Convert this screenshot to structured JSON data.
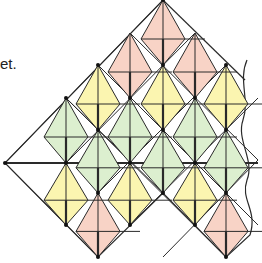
{
  "caption": "et.",
  "colors": {
    "pink": "#f8d3c6",
    "yellow": "#fbf5b0",
    "green": "#dcefcf",
    "stroke": "#2a2a2a"
  },
  "kites": [
    {
      "color": "pink",
      "x": 163,
      "top": 0,
      "h": 65
    },
    {
      "color": "pink",
      "x": 195,
      "top": 33,
      "h": 65
    },
    {
      "color": "pink",
      "x": 130,
      "top": 33,
      "h": 65
    },
    {
      "color": "yellow",
      "x": 98,
      "top": 65,
      "h": 65
    },
    {
      "color": "yellow",
      "x": 163,
      "top": 65,
      "h": 65
    },
    {
      "color": "yellow",
      "x": 226,
      "top": 65,
      "h": 65
    },
    {
      "color": "green",
      "x": 66,
      "top": 98,
      "h": 65
    },
    {
      "color": "green",
      "x": 130,
      "top": 98,
      "h": 65
    },
    {
      "color": "green",
      "x": 195,
      "top": 98,
      "h": 65
    },
    {
      "color": "green",
      "x": 98,
      "top": 130,
      "h": 63
    },
    {
      "color": "green",
      "x": 163,
      "top": 130,
      "h": 63
    },
    {
      "color": "green",
      "x": 226,
      "top": 130,
      "h": 63
    },
    {
      "color": "yellow",
      "x": 66,
      "top": 163,
      "h": 62
    },
    {
      "color": "yellow",
      "x": 130,
      "top": 163,
      "h": 62
    },
    {
      "color": "yellow",
      "x": 195,
      "top": 163,
      "h": 62
    },
    {
      "color": "pink",
      "x": 98,
      "top": 193,
      "h": 64
    },
    {
      "color": "pink",
      "x": 226,
      "top": 193,
      "h": 64
    }
  ],
  "outline": [
    [
      163,
      0
    ],
    [
      5,
      163
    ],
    [
      98,
      257
    ],
    [
      163,
      225
    ],
    [
      226,
      257
    ],
    [
      240,
      225
    ]
  ],
  "vertices": [
    [
      163,
      0
    ],
    [
      98,
      65
    ],
    [
      66,
      98
    ],
    [
      5,
      163
    ],
    [
      163,
      65
    ],
    [
      226,
      65
    ],
    [
      130,
      98
    ],
    [
      195,
      98
    ],
    [
      98,
      130
    ],
    [
      163,
      130
    ],
    [
      226,
      130
    ],
    [
      66,
      163
    ],
    [
      130,
      163
    ],
    [
      195,
      163
    ],
    [
      98,
      193
    ],
    [
      163,
      193
    ],
    [
      226,
      193
    ],
    [
      66,
      225
    ],
    [
      130,
      225
    ],
    [
      195,
      225
    ],
    [
      98,
      257
    ],
    [
      226,
      257
    ]
  ]
}
